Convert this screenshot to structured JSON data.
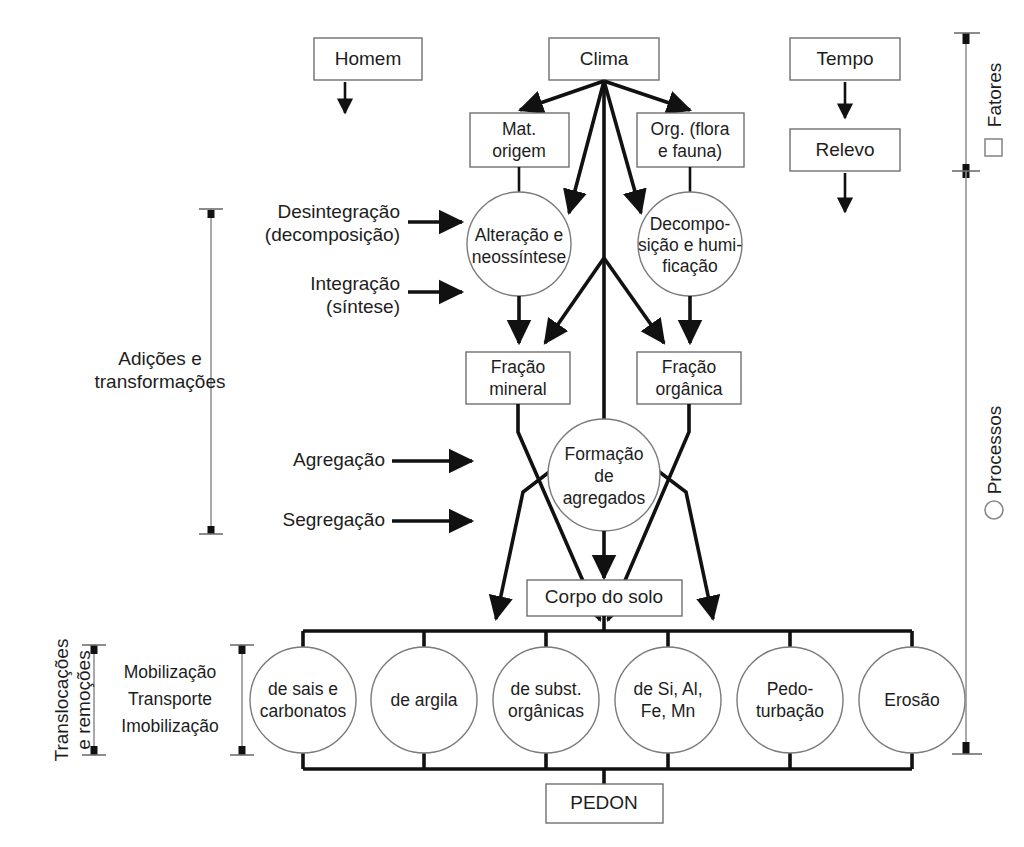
{
  "diagram": {
    "colors": {
      "line": "#111111",
      "shape_stroke": "#6f6f6f",
      "bracket": "#8d8d8d",
      "background": "#ffffff"
    }
  },
  "factors": {
    "homem": "Homem",
    "clima": "Clima",
    "tempo": "Tempo",
    "relevo": "Relevo",
    "mat_origem_l1": "Mat.",
    "mat_origem_l2": "origem",
    "org_l1": "Org. (flora",
    "org_l2": "e fauna)"
  },
  "circles_mid": {
    "alteracao_l1": "Alteração e",
    "alteracao_l2": "neossíntese",
    "decomposicao_l1": "Decompo-",
    "decomposicao_l2": "sição e humi-",
    "decomposicao_l3": "ficação",
    "formacao_l1": "Formação",
    "formacao_l2": "de",
    "formacao_l3": "agregados"
  },
  "fractions": {
    "mineral_l1": "Fração",
    "mineral_l2": "mineral",
    "organica_l1": "Fração",
    "organica_l2": "orgânica"
  },
  "body": {
    "corpo_do_solo": "Corpo do solo",
    "pedon": "PEDON"
  },
  "left_process_labels": {
    "desintegracao_l1": "Desintegração",
    "desintegracao_l2": "(decomposição)",
    "integracao_l1": "Integração",
    "integracao_l2": "(síntese)",
    "agregacao": "Agregação",
    "segregacao": "Segregação"
  },
  "left_brackets": {
    "adicoes_l1": "Adições e",
    "adicoes_l2": "transformações",
    "translocacoes_l1": "Translocações",
    "translocacoes_l2": "e remoções",
    "mobilizacao_l1": "Mobilização",
    "mobilizacao_l2": "Transporte",
    "mobilizacao_l3": "Imobilização"
  },
  "right_brackets": {
    "fatores": "Fatores",
    "processos": "Processos",
    "fatores_marker": "square-marker",
    "processos_marker": "circle-marker"
  },
  "translocation_circles": [
    {
      "l1": "de sais e",
      "l2": "carbonatos"
    },
    {
      "l1": "de argila",
      "l2": ""
    },
    {
      "l1": "de subst.",
      "l2": "orgânicas"
    },
    {
      "l1": "de Si, Al,",
      "l2": "Fe, Mn"
    },
    {
      "l1": "Pedo-",
      "l2": "turbação"
    },
    {
      "l1": "Erosão",
      "l2": ""
    }
  ]
}
